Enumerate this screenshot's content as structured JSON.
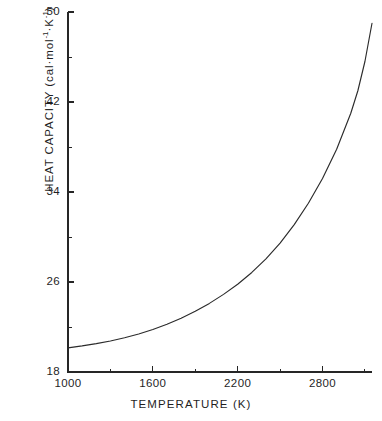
{
  "chart_data": {
    "type": "line",
    "title": "",
    "subtitle": "",
    "xlabel": "TEMPERATURE  (K)",
    "ylabel": "HEAT  CAPACITY  (cal·mol⁻¹·K⁻¹)",
    "ylabel_parts": {
      "prefix": "HEAT  CAPACITY  (cal·mol",
      "exp1": "-1",
      "middle": "·K",
      "exp2": "-1",
      "suffix": ")"
    },
    "xlim": [
      1000,
      3150
    ],
    "ylim": [
      18,
      50
    ],
    "grid": false,
    "legend": false,
    "legend_position": "none",
    "x_ticks_major": [
      1000,
      1600,
      2200,
      2800
    ],
    "x_ticks_major_labels": [
      "1000",
      "1600",
      "2200",
      "2800"
    ],
    "x_ticks_minor": [
      1300,
      1900,
      2500,
      3100
    ],
    "y_ticks_major": [
      18,
      26,
      34,
      42,
      50
    ],
    "y_ticks_major_labels": [
      "18",
      "26",
      "34",
      "42",
      "50"
    ],
    "y_ticks_minor": [
      22,
      30,
      38,
      46
    ],
    "series": [
      {
        "name": "Heat capacity",
        "color": "#2b2b2b",
        "x": [
          1000,
          1100,
          1200,
          1300,
          1400,
          1500,
          1600,
          1700,
          1800,
          1900,
          2000,
          2100,
          2200,
          2300,
          2400,
          2500,
          2600,
          2700,
          2800,
          2900,
          3000,
          3050,
          3100,
          3150
        ],
        "y": [
          20.15,
          20.32,
          20.52,
          20.76,
          21.04,
          21.38,
          21.78,
          22.24,
          22.78,
          23.4,
          24.1,
          24.9,
          25.8,
          26.85,
          28.05,
          29.45,
          31.1,
          33.0,
          35.2,
          37.8,
          41.0,
          43.0,
          45.6,
          49.0
        ]
      }
    ]
  },
  "axes": {
    "x_axis_name": "temperature-axis",
    "y_axis_name": "heat-capacity-axis"
  }
}
